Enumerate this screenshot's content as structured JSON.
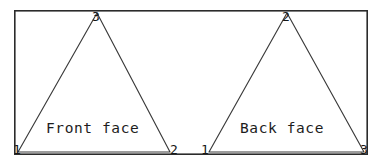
{
  "figure": {
    "background_color": "#ffffff",
    "line_color": "#2b2b2b",
    "border": {
      "x": 14,
      "y": 10,
      "width": 354,
      "height": 145,
      "stroke_width": 1.6
    },
    "triangles": [
      {
        "name": "front-face",
        "caption": "Front face",
        "apex": {
          "label": "3",
          "x": 97,
          "y": 13
        },
        "bottom_left": {
          "label": "1",
          "x": 18,
          "y": 152
        },
        "bottom_right": {
          "label": "2",
          "x": 170,
          "y": 152
        }
      },
      {
        "name": "back-face",
        "caption": "Back face",
        "apex": {
          "label": "2",
          "x": 287,
          "y": 13
        },
        "bottom_left": {
          "label": "1",
          "x": 209,
          "y": 152
        },
        "bottom_right": {
          "label": "3",
          "x": 364,
          "y": 152
        }
      }
    ]
  },
  "labels": {
    "front_face": "Front face",
    "back_face": "Back face",
    "front_v3": "3",
    "front_v1": "1",
    "front_v2": "2",
    "back_v2": "2",
    "back_v1": "1",
    "back_v3": "3"
  }
}
